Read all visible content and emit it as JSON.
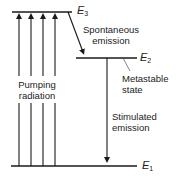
{
  "diagram": {
    "levels": [
      {
        "id": "E3",
        "symbol": "E",
        "subscript": "3"
      },
      {
        "id": "E2",
        "symbol": "E",
        "subscript": "2"
      },
      {
        "id": "E1",
        "symbol": "E",
        "subscript": "1"
      }
    ],
    "labels": {
      "pumping_line1": "Pumping",
      "pumping_line2": "radiation",
      "spontaneous_line1": "Spontaneous",
      "spontaneous_line2": "emission",
      "metastable_line1": "Metastable",
      "metastable_line2": "state",
      "stimulated_line1": "Stimulated",
      "stimulated_line2": "emission"
    },
    "transitions": [
      {
        "from": "E1",
        "to": "E3",
        "label": "Pumping radiation",
        "count": 4
      },
      {
        "from": "E3",
        "to": "E2",
        "label": "Spontaneous emission"
      },
      {
        "from": "E2",
        "to": "E1",
        "label": "Stimulated emission"
      }
    ],
    "colors": {
      "line": "#1a1a1a",
      "text": "#222222",
      "background": "#ffffff"
    }
  }
}
